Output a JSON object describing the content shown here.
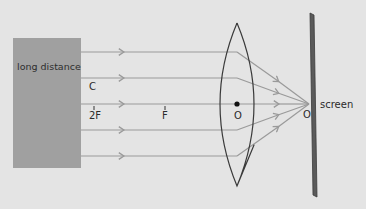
{
  "diagram": {
    "type": "optics-ray-diagram",
    "object": {
      "label": "long distance",
      "color": "#a0a0a0"
    },
    "lens": {
      "type": "convex",
      "center_label": "O"
    },
    "axis_labels": {
      "c": "C",
      "two_f": "2F",
      "f": "F",
      "lens_center": "O",
      "image_point": "O"
    },
    "screen": {
      "label": "screen",
      "color": "#5a5a5a"
    },
    "rays": {
      "count": 5,
      "color": "#9a9a9a",
      "direction": "left-to-right",
      "behavior": "parallel rays converge at focal point on screen"
    },
    "colors": {
      "background": "#e4e4e4",
      "lens_outline": "#3a3a3a",
      "ray": "#9a9a9a",
      "screen": "#5a5a5a",
      "text": "#2a2a2a"
    }
  }
}
